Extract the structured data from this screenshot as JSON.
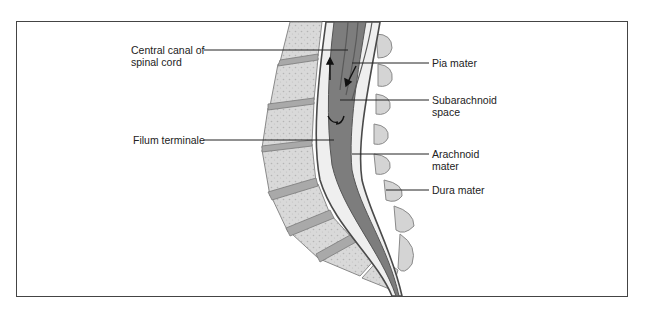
{
  "figure": {
    "labels": {
      "central_canal": [
        "Central canal of",
        "spinal cord"
      ],
      "filum_terminale": "Filum terminale",
      "pia_mater": "Pia mater",
      "subarachnoid_space": [
        "Subarachnoid",
        "space"
      ],
      "arachnoid_mater": [
        "Arachnoid",
        "mater"
      ],
      "dura_mater": "Dura mater"
    },
    "colors": {
      "bone": "#d8d8d8",
      "bone_texture": "#b8b8b8",
      "disc": "#a8a8a8",
      "cord": "#7a7a7a",
      "membrane": "#5a5a5a",
      "csf": "#efefef",
      "line": "#222222"
    }
  }
}
